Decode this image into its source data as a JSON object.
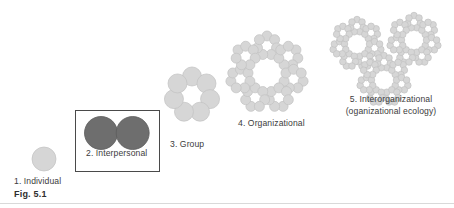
{
  "figure": {
    "number": "Fig. 5.1",
    "background_color": "#ffffff",
    "rule_color": "#d9d9d9"
  },
  "colors": {
    "unit_light": "#d6d6d6",
    "unit_light_stroke": "#c2c2c2",
    "unit_dark": "#6e6e6e",
    "unit_dark_stroke": "#5d5d5d",
    "box_border": "#4a4a4a",
    "text": "#3c3c3c"
  },
  "levels": [
    {
      "id": "individual",
      "number": "1.",
      "name": "Individual",
      "label": "1. Individual",
      "shade": "light",
      "structure": "single-circle",
      "unit_count": 1,
      "boxed": false
    },
    {
      "id": "interpersonal",
      "number": "2.",
      "name": "Interpersonal",
      "label": "2. Interpersonal",
      "shade": "dark",
      "structure": "dyad-touching-circles",
      "unit_count": 2,
      "boxed": true
    },
    {
      "id": "group",
      "number": "3.",
      "name": "Group",
      "label": "3. Group",
      "shade": "light",
      "structure": "ring-of-circles",
      "unit_count": 7,
      "boxed": false
    },
    {
      "id": "organizational",
      "number": "4.",
      "name": "Organizational",
      "label": "4. Organizational",
      "shade": "light",
      "structure": "ring-of-groups",
      "unit_count": 7,
      "boxed": false
    },
    {
      "id": "interorganizational",
      "number": "5.",
      "name": "Interorganizational",
      "label": "5. Interorganizational",
      "sublabel": "(oganizational ecology)",
      "shade": "light",
      "structure": "cluster-of-organizations",
      "unit_count": 3,
      "boxed": false
    }
  ]
}
